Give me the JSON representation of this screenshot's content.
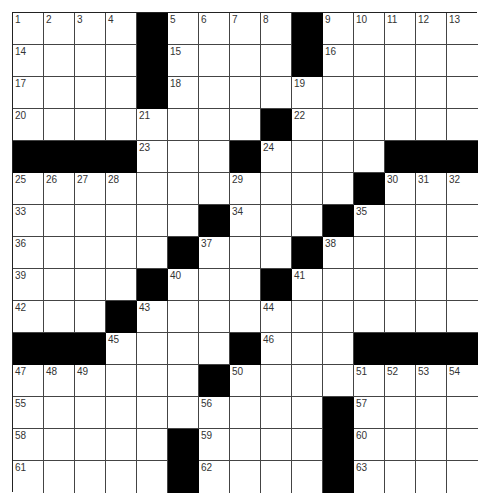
{
  "puzzle": {
    "size": 15,
    "rows": [
      ".....#.....#.....",
      "x"
    ],
    "grid": [
      "....#....#.....",
      "....#....#.....",
      "....#..........",
      "........#......",
      "####...#....###",
      "...........#...",
      "......#...#....",
      ".....#...#.....",
      "....#...#......",
      "...#...........",
      "###....#...####",
      "......#........",
      "..........#....",
      ".....#....#....",
      ".....#....#...."
    ],
    "numbers": [
      {
        "r": 0,
        "c": 0,
        "n": "1"
      },
      {
        "r": 0,
        "c": 1,
        "n": "2"
      },
      {
        "r": 0,
        "c": 2,
        "n": "3"
      },
      {
        "r": 0,
        "c": 3,
        "n": "4"
      },
      {
        "r": 0,
        "c": 5,
        "n": "5"
      },
      {
        "r": 0,
        "c": 6,
        "n": "6"
      },
      {
        "r": 0,
        "c": 7,
        "n": "7"
      },
      {
        "r": 0,
        "c": 8,
        "n": "8"
      },
      {
        "r": 0,
        "c": 10,
        "n": "9"
      },
      {
        "r": 0,
        "c": 11,
        "n": "10"
      },
      {
        "r": 0,
        "c": 12,
        "n": "11"
      },
      {
        "r": 0,
        "c": 13,
        "n": "12"
      },
      {
        "r": 0,
        "c": 14,
        "n": "13"
      },
      {
        "r": 1,
        "c": 0,
        "n": "14"
      },
      {
        "r": 1,
        "c": 5,
        "n": "15"
      },
      {
        "r": 1,
        "c": 10,
        "n": "16"
      },
      {
        "r": 2,
        "c": 0,
        "n": "17"
      },
      {
        "r": 2,
        "c": 5,
        "n": "18"
      },
      {
        "r": 2,
        "c": 9,
        "n": "19"
      },
      {
        "r": 3,
        "c": 0,
        "n": "20"
      },
      {
        "r": 3,
        "c": 4,
        "n": "21"
      },
      {
        "r": 3,
        "c": 9,
        "n": "22"
      },
      {
        "r": 4,
        "c": 4,
        "n": "23"
      },
      {
        "r": 4,
        "c": 8,
        "n": "24"
      },
      {
        "r": 5,
        "c": 0,
        "n": "25"
      },
      {
        "r": 5,
        "c": 1,
        "n": "26"
      },
      {
        "r": 5,
        "c": 2,
        "n": "27"
      },
      {
        "r": 5,
        "c": 3,
        "n": "28"
      },
      {
        "r": 5,
        "c": 7,
        "n": "29"
      },
      {
        "r": 5,
        "c": 12,
        "n": "30"
      },
      {
        "r": 5,
        "c": 13,
        "n": "31"
      },
      {
        "r": 5,
        "c": 14,
        "n": "32"
      },
      {
        "r": 6,
        "c": 0,
        "n": "33"
      },
      {
        "r": 6,
        "c": 7,
        "n": "34"
      },
      {
        "r": 6,
        "c": 11,
        "n": "35"
      },
      {
        "r": 7,
        "c": 0,
        "n": "36"
      },
      {
        "r": 7,
        "c": 6,
        "n": "37"
      },
      {
        "r": 7,
        "c": 10,
        "n": "38"
      },
      {
        "r": 8,
        "c": 0,
        "n": "39"
      },
      {
        "r": 8,
        "c": 5,
        "n": "40"
      },
      {
        "r": 8,
        "c": 9,
        "n": "41"
      },
      {
        "r": 9,
        "c": 0,
        "n": "42"
      },
      {
        "r": 9,
        "c": 4,
        "n": "43"
      },
      {
        "r": 9,
        "c": 8,
        "n": "44"
      },
      {
        "r": 10,
        "c": 3,
        "n": "45"
      },
      {
        "r": 10,
        "c": 8,
        "n": "46"
      },
      {
        "r": 11,
        "c": 0,
        "n": "47"
      },
      {
        "r": 11,
        "c": 1,
        "n": "48"
      },
      {
        "r": 11,
        "c": 2,
        "n": "49"
      },
      {
        "r": 11,
        "c": 7,
        "n": "50"
      },
      {
        "r": 11,
        "c": 11,
        "n": "51"
      },
      {
        "r": 11,
        "c": 12,
        "n": "52"
      },
      {
        "r": 11,
        "c": 13,
        "n": "53"
      },
      {
        "r": 11,
        "c": 14,
        "n": "54"
      },
      {
        "r": 12,
        "c": 0,
        "n": "55"
      },
      {
        "r": 12,
        "c": 6,
        "n": "56"
      },
      {
        "r": 12,
        "c": 11,
        "n": "57"
      },
      {
        "r": 13,
        "c": 0,
        "n": "58"
      },
      {
        "r": 13,
        "c": 6,
        "n": "59"
      },
      {
        "r": 13,
        "c": 11,
        "n": "60"
      },
      {
        "r": 14,
        "c": 0,
        "n": "61"
      },
      {
        "r": 14,
        "c": 6,
        "n": "62"
      },
      {
        "r": 14,
        "c": 11,
        "n": "63"
      }
    ]
  }
}
